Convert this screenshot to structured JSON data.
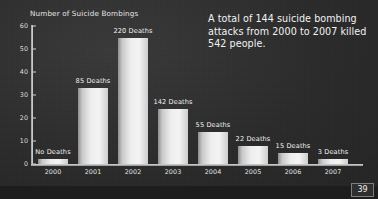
{
  "slide": {
    "page_number": "39",
    "background_color": "#2b2b2b",
    "bar_color": "#eeeeee",
    "text_color": "#f0f0f0",
    "annotation": "A total of 144 suicide bombing attacks from 2000 to 2007 killed 542 people."
  },
  "chart_data": {
    "type": "bar",
    "title": "",
    "ylabel": "Number of Suicide Bombings",
    "xlabel": "",
    "ylim": [
      0,
      60
    ],
    "yticks": [
      0,
      10,
      20,
      30,
      40,
      50,
      60
    ],
    "ytick_labels": [
      "0",
      "10",
      "20",
      "30",
      "40",
      "50",
      "60"
    ],
    "grid": false,
    "legend": "none",
    "categories": [
      "2000",
      "2001",
      "2002",
      "2003",
      "2004",
      "2005",
      "2006",
      "2007"
    ],
    "values": [
      2,
      33,
      55,
      24,
      14,
      8,
      5,
      2
    ],
    "point_labels": [
      "No Deaths",
      "85 Deaths",
      "220 Deaths",
      "142 Deaths",
      "55 Deaths",
      "22 Deaths",
      "15 Deaths",
      "3 Deaths"
    ],
    "deaths": [
      0,
      85,
      220,
      142,
      55,
      22,
      15,
      3
    ],
    "total_attacks": 144,
    "total_deaths": 542
  }
}
